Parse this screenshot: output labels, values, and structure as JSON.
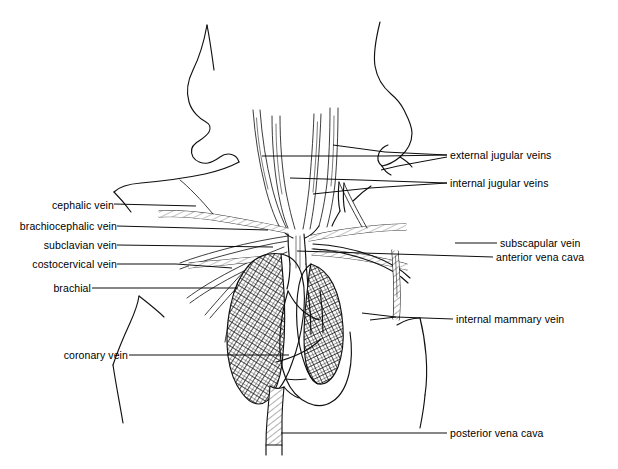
{
  "figure": {
    "type": "anatomical-line-diagram",
    "background_color": "#ffffff",
    "ink_color": "#111111",
    "width": 618,
    "height": 469
  },
  "labels": {
    "left": [
      {
        "id": "cephalic-vein",
        "text": "cephalic vein",
        "x": 38,
        "y": 200
      },
      {
        "id": "brachiocephalic-vein",
        "text": "brachiocephalic vein",
        "x": 11,
        "y": 222
      },
      {
        "id": "subclavian-vein",
        "text": "subclavian vein",
        "x": 28,
        "y": 241
      },
      {
        "id": "costocervical-vein",
        "text": "costocervical vein",
        "x": 17,
        "y": 260
      },
      {
        "id": "brachial",
        "text": "brachial",
        "x": 52,
        "y": 284
      },
      {
        "id": "coronary-vein",
        "text": "coronary vein",
        "x": 52,
        "y": 351
      }
    ],
    "right": [
      {
        "id": "external-jugular-veins",
        "text": "external jugular veins",
        "x": 450,
        "y": 151
      },
      {
        "id": "internal-jugular-veins",
        "text": "internal jugular veins",
        "x": 450,
        "y": 179
      },
      {
        "id": "subscapular-vein",
        "text": "subscapular vein",
        "x": 500,
        "y": 239
      },
      {
        "id": "anterior-vena-cava",
        "text": "anterior vena cava",
        "x": 496,
        "y": 253
      },
      {
        "id": "internal-mammary-vein",
        "text": "internal mammary vein",
        "x": 456,
        "y": 315
      },
      {
        "id": "posterior-vena-cava",
        "text": "posterior vena cava",
        "x": 450,
        "y": 429
      }
    ]
  }
}
